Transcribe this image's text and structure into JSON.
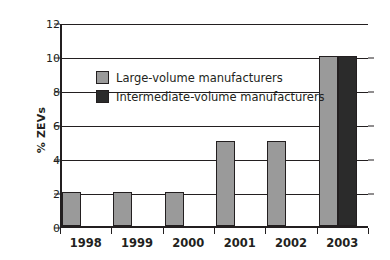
{
  "chart_data": {
    "type": "bar",
    "title": "",
    "xlabel": "",
    "ylabel": "% ZEVs",
    "categories": [
      "1998",
      "1999",
      "2000",
      "2001",
      "2002",
      "2003"
    ],
    "ylim": [
      0,
      12
    ],
    "yticks": [
      0,
      2,
      4,
      6,
      8,
      10,
      12
    ],
    "grid": true,
    "legend_position": "inside-upper-left",
    "series": [
      {
        "name": "Large-volume manufacturers",
        "color": "#9a9a9a",
        "values": [
          2,
          2,
          2,
          5,
          5,
          10
        ]
      },
      {
        "name": "Intermediate-volume manufacturers",
        "color": "#2b2b2b",
        "values": [
          null,
          null,
          null,
          null,
          null,
          10
        ]
      }
    ]
  },
  "axes": {
    "y_title": "% ZEVs",
    "y_tick_labels": [
      "0",
      "2",
      "4",
      "6",
      "8",
      "10",
      "12"
    ],
    "x_tick_labels": [
      "1998",
      "1999",
      "2000",
      "2001",
      "2002",
      "2003"
    ]
  },
  "legend": {
    "items": [
      {
        "label": "Large-volume manufacturers",
        "color": "#9a9a9a"
      },
      {
        "label": "Intermediate-volume manufacturers",
        "color": "#2b2b2b"
      }
    ]
  },
  "style": {
    "axis_color": "#231f20",
    "background": "#ffffff"
  }
}
